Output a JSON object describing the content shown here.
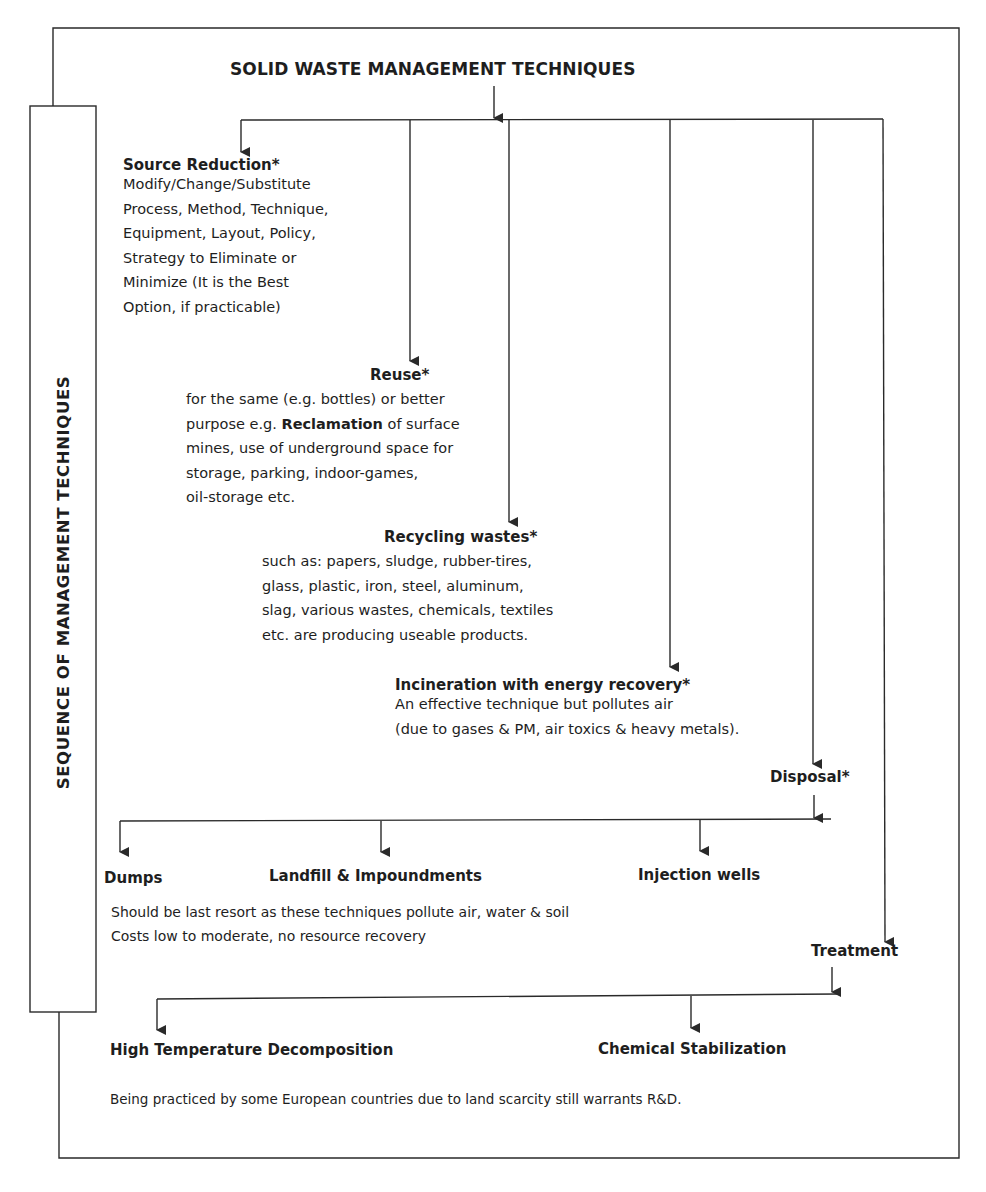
{
  "diagram": {
    "title": "SOLID WASTE MANAGEMENT TECHNIQUES",
    "side_label": "SEQUENCE  OF MANAGEMENT TECHNIQUES",
    "source_reduction": {
      "heading": "Source Reduction*",
      "lines": [
        "Modify/Change/Substitute",
        "Process, Method, Technique,",
        "Equipment, Layout, Policy,",
        "Strategy to Eliminate or",
        "Minimize (It is the Best",
        "Option, if practicable)"
      ]
    },
    "reuse": {
      "heading": "Reuse*",
      "line1": "for the same (e.g. bottles) or better",
      "line2_pre": "purpose e.g. ",
      "line2_bold": "Reclamation",
      "line2_post": " of surface",
      "line3": "mines, use of underground space for",
      "line4": "storage, parking, indoor-games,",
      "line5": "oil-storage etc."
    },
    "recycling": {
      "heading": "Recycling wastes*",
      "lines": [
        "such as: papers, sludge, rubber-tires,",
        "glass, plastic, iron, steel, aluminum,",
        "slag, various wastes, chemicals, textiles",
        "etc. are producing useable products."
      ]
    },
    "incineration": {
      "heading": "Incineration with energy recovery*",
      "lines": [
        "An effective technique but pollutes air",
        "(due to gases & PM, air toxics & heavy metals)."
      ]
    },
    "disposal": {
      "heading": "Disposal*",
      "options": [
        "Dumps",
        "Landfill & Impoundments",
        "Injection wells"
      ],
      "notes": [
        "Should be last resort as these techniques pollute air, water & soil",
        "Costs low to moderate, no resource recovery"
      ]
    },
    "treatment": {
      "heading": "Treatment",
      "options": [
        "High Temperature Decomposition",
        "Chemical Stabilization"
      ],
      "note": "Being practiced by some European countries due to land scarcity still warrants R&D."
    }
  },
  "colors": {
    "line": "#2a2a2a",
    "text": "#1e1e1e",
    "background": "#ffffff"
  }
}
